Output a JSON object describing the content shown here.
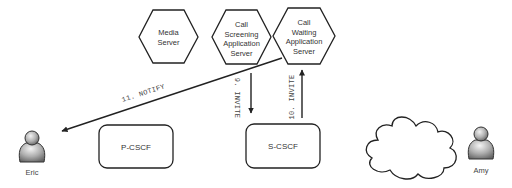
{
  "diagram": {
    "servers": [
      {
        "id": "media-server",
        "lines": [
          "Media",
          "Server"
        ]
      },
      {
        "id": "call-screening-as",
        "lines": [
          "Call",
          "Screening",
          "Application",
          "Server"
        ]
      },
      {
        "id": "call-waiting-as",
        "lines": [
          "Call",
          "Waiting",
          "Application",
          "Server"
        ]
      }
    ],
    "boxes": [
      {
        "id": "p-cscf",
        "label": "P-CSCF"
      },
      {
        "id": "s-cscf",
        "label": "S-CSCF"
      }
    ],
    "actors": [
      {
        "id": "eric",
        "label": "Eric"
      },
      {
        "id": "amy",
        "label": "Amy"
      }
    ],
    "messages": [
      {
        "id": "msg-9",
        "label": "9. INVITE",
        "from": "s-cscf",
        "to": "call-screening-as",
        "direction": "down"
      },
      {
        "id": "msg-10",
        "label": "10. INVITE",
        "from": "s-cscf",
        "to": "call-waiting-as",
        "direction": "up"
      },
      {
        "id": "msg-11",
        "label": "11. NOTIFY",
        "from": "call-waiting-as",
        "to": "eric"
      }
    ],
    "colors": {
      "stroke": "#222222",
      "text": "#333333",
      "actor_fill": "#9a9a9a"
    }
  }
}
